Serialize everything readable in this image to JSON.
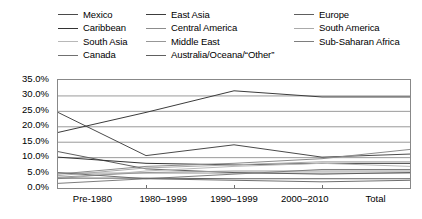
{
  "chart_data": {
    "type": "line",
    "title": "",
    "xlabel": "",
    "ylabel": "",
    "categories": [
      "Pre-1980",
      "1980–1999",
      "1990–1999",
      "2000–2010",
      "Total"
    ],
    "ylim": [
      0,
      35
    ],
    "yticks": [
      "0.0%",
      "5.0%",
      "10.0%",
      "15.0%",
      "20.0%",
      "25.0%",
      "30.0%",
      "35.0%"
    ],
    "ytick_values": [
      0,
      5,
      10,
      15,
      20,
      25,
      30,
      35
    ],
    "grid": true,
    "legend_position": "top",
    "legend_columns": 3,
    "series": [
      {
        "name": "Mexico",
        "color": "#4a4a4a",
        "values": [
          24.5,
          10.5,
          14.0,
          10.0,
          11.0
        ]
      },
      {
        "name": "East Asia",
        "color": "#3c3c3c",
        "values": [
          18.0,
          24.5,
          31.5,
          29.5,
          29.5
        ]
      },
      {
        "name": "Europe",
        "color": "#5e5e5e",
        "values": [
          11.8,
          6.2,
          5.0,
          4.5,
          5.0
        ]
      },
      {
        "name": "Caribbean",
        "color": "#333333",
        "values": [
          10.0,
          8.0,
          7.5,
          8.0,
          8.0
        ]
      },
      {
        "name": "Central America",
        "color": "#8c8c8c",
        "values": [
          4.5,
          7.0,
          8.0,
          9.5,
          12.5
        ]
      },
      {
        "name": "South America",
        "color": "#aaaaaa",
        "values": [
          4.0,
          6.5,
          7.5,
          8.5,
          8.5
        ]
      },
      {
        "name": "South Asia",
        "color": "#b8b8b8",
        "values": [
          3.0,
          5.5,
          7.0,
          8.0,
          7.0
        ]
      },
      {
        "name": "Middle East",
        "color": "#979797",
        "values": [
          3.5,
          5.0,
          5.5,
          5.5,
          5.5
        ]
      },
      {
        "name": "Sub-Saharan Africa",
        "color": "#7e7e7e",
        "values": [
          1.5,
          3.0,
          4.5,
          6.0,
          6.0
        ]
      },
      {
        "name": "Canada",
        "color": "#707070",
        "values": [
          5.0,
          3.0,
          2.5,
          2.0,
          2.5
        ]
      },
      {
        "name": "Australia/Oceana/“Other”",
        "color": "#606060",
        "values": [
          3.2,
          3.2,
          3.0,
          3.0,
          3.0
        ]
      }
    ]
  },
  "legend": {
    "columns": [
      [
        "Mexico",
        "Caribbean",
        "South Asia",
        "Canada"
      ],
      [
        "East Asia",
        "Central America",
        "Middle East",
        "Australia/Oceana/“Other”"
      ],
      [
        "Europe",
        "South America",
        "Sub-Saharan Africa"
      ]
    ]
  }
}
